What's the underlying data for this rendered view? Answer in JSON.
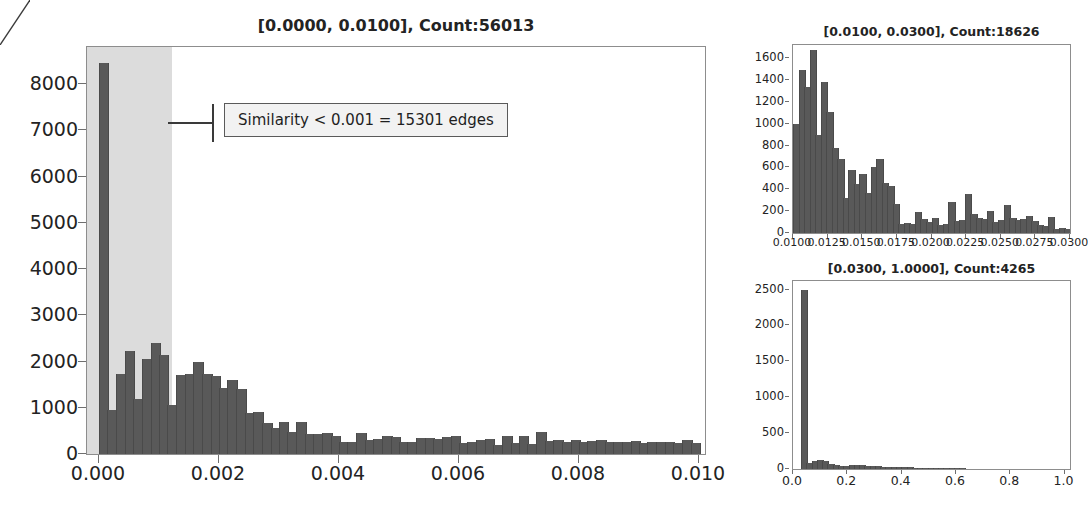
{
  "figure": {
    "bar_color": "#595959",
    "shade_color": "#dcdcdc",
    "axis_color": "#8d8d8d"
  },
  "annotation": {
    "text": "Similarity < 0.001 = 15301 edges"
  },
  "chart_data": [
    {
      "id": "main",
      "type": "bar",
      "title": "[0.0000, 0.0100], Count:56013",
      "xlabel": "",
      "ylabel": "",
      "xlim": [
        -0.0002,
        0.0101
      ],
      "ylim": [
        0,
        8800
      ],
      "grid": false,
      "legend": "none",
      "bin_width": 0.00014286,
      "xticks": [
        "0.000",
        "0.002",
        "0.004",
        "0.006",
        "0.008",
        "0.010"
      ],
      "xtick_values": [
        0.0,
        0.002,
        0.004,
        0.006,
        0.008,
        0.01
      ],
      "yticks": [
        "0",
        "1000",
        "2000",
        "3000",
        "4000",
        "5000",
        "6000",
        "7000",
        "8000"
      ],
      "ytick_values": [
        0,
        1000,
        2000,
        3000,
        4000,
        5000,
        6000,
        7000,
        8000
      ],
      "shaded_span": [
        -0.0002,
        0.00122
      ],
      "x": [
        7e-05,
        0.00021,
        0.00036,
        0.0005,
        0.00064,
        0.00079,
        0.00093,
        0.00107,
        0.00121,
        0.00136,
        0.0015,
        0.00164,
        0.00179,
        0.00193,
        0.00207,
        0.00221,
        0.00236,
        0.0025,
        0.00264,
        0.00279,
        0.00293,
        0.00307,
        0.00321,
        0.00336,
        0.0035,
        0.00364,
        0.00379,
        0.00393,
        0.00407,
        0.00421,
        0.00436,
        0.0045,
        0.00464,
        0.00479,
        0.00493,
        0.00507,
        0.00521,
        0.00536,
        0.0055,
        0.00564,
        0.00579,
        0.00593,
        0.00607,
        0.00621,
        0.00636,
        0.0065,
        0.00664,
        0.00679,
        0.00693,
        0.00707,
        0.00721,
        0.00736,
        0.0075,
        0.00764,
        0.00779,
        0.00793,
        0.00807,
        0.00821,
        0.00836,
        0.0085,
        0.00864,
        0.00879,
        0.00893,
        0.00907,
        0.00921,
        0.00936,
        0.0095,
        0.00964,
        0.00979,
        0.00993
      ],
      "values": [
        8450,
        960,
        1740,
        2220,
        1200,
        2060,
        2400,
        2150,
        1070,
        1700,
        1720,
        1990,
        1740,
        1690,
        1430,
        1600,
        1400,
        880,
        900,
        680,
        560,
        700,
        480,
        690,
        430,
        430,
        460,
        400,
        250,
        260,
        450,
        310,
        320,
        380,
        370,
        260,
        250,
        340,
        350,
        330,
        370,
        380,
        240,
        250,
        310,
        320,
        200,
        390,
        230,
        380,
        210,
        480,
        280,
        300,
        250,
        300,
        270,
        280,
        300,
        260,
        250,
        270,
        290,
        240,
        260,
        250,
        270,
        230,
        300,
        240
      ]
    },
    {
      "id": "top-right",
      "type": "bar",
      "title": "[0.0100, 0.0300], Count:18626",
      "xlabel": "",
      "ylabel": "",
      "xlim": [
        0.01,
        0.03
      ],
      "ylim": [
        0,
        1720
      ],
      "grid": false,
      "legend": "none",
      "xticks": [
        "0.0100",
        "0.0125",
        "0.0150",
        "0.0175",
        "0.0200",
        "0.0225",
        "0.0250",
        "0.0275",
        "0.0300"
      ],
      "xtick_values": [
        0.01,
        0.0125,
        0.015,
        0.0175,
        0.02,
        0.0225,
        0.025,
        0.0275,
        0.03
      ],
      "yticks": [
        "0",
        "200",
        "400",
        "600",
        "800",
        "1000",
        "1200",
        "1400",
        "1600"
      ],
      "ytick_values": [
        0,
        200,
        400,
        600,
        800,
        1000,
        1200,
        1400,
        1600
      ],
      "bin_width": 0.0004,
      "values": [
        1000,
        1490,
        1340,
        1670,
        900,
        1380,
        1110,
        780,
        680,
        320,
        580,
        450,
        540,
        370,
        600,
        680,
        460,
        430,
        270,
        80,
        90,
        80,
        190,
        130,
        100,
        140,
        70,
        80,
        280,
        110,
        120,
        360,
        170,
        140,
        130,
        200,
        100,
        120,
        260,
        140,
        120,
        130,
        160,
        110,
        70,
        60,
        150,
        40,
        50,
        40
      ]
    },
    {
      "id": "bottom-right",
      "type": "bar",
      "title": "[0.0300, 1.0000], Count:4265",
      "xlabel": "",
      "ylabel": "",
      "xlim": [
        0.0,
        1.02
      ],
      "ylim": [
        0,
        2620
      ],
      "grid": false,
      "legend": "none",
      "xticks": [
        "0.0",
        "0.2",
        "0.4",
        "0.6",
        "0.8",
        "1.0"
      ],
      "xtick_values": [
        0.0,
        0.2,
        0.4,
        0.6,
        0.8,
        1.0
      ],
      "yticks": [
        "0",
        "500",
        "1000",
        "1500",
        "2000",
        "2500"
      ],
      "ytick_values": [
        0,
        500,
        1000,
        1500,
        2000,
        2500
      ],
      "bin_width": 0.0194,
      "x_start": 0.03,
      "values": [
        2490,
        90,
        110,
        120,
        110,
        70,
        50,
        45,
        40,
        55,
        60,
        50,
        45,
        40,
        38,
        35,
        30,
        28,
        25,
        24,
        22,
        20,
        18,
        16,
        14,
        12,
        11,
        10,
        9,
        8,
        8,
        7,
        7,
        6,
        6,
        5,
        5,
        4,
        4,
        4,
        3,
        3,
        3,
        2,
        2,
        2,
        2,
        2,
        1,
        1
      ]
    }
  ]
}
